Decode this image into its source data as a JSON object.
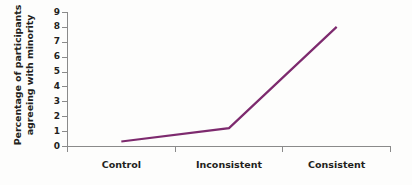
{
  "chart_data": {
    "type": "line",
    "title": "",
    "subtitle": "",
    "xlabel": "",
    "ylabel": "Percentage of participants agreeing with minority",
    "ylabel_lines": [
      "Percentage of participants",
      "agreeing with minority"
    ],
    "categories": [
      "Control",
      "Inconsistent",
      "Consistent"
    ],
    "values": [
      0.3,
      1.2,
      8.0
    ],
    "series": [
      {
        "name": "Percentage agreeing with minority",
        "values": [
          0.3,
          1.2,
          8.0
        ],
        "color": "#7d2a6e"
      }
    ],
    "ylim": [
      0,
      9
    ],
    "xlim": [
      0,
      3
    ],
    "ytick_labels": [
      "0",
      "1",
      "2",
      "3",
      "4",
      "5",
      "6",
      "7",
      "8",
      "9"
    ],
    "ytick_values": [
      0,
      1,
      2,
      3,
      4,
      5,
      6,
      7,
      8,
      9
    ],
    "grid": false,
    "legend": false,
    "legend_position": "none",
    "axis_color": "#8a8a8a",
    "background_color": "#fdfdfc",
    "text_color": "#231f20"
  }
}
